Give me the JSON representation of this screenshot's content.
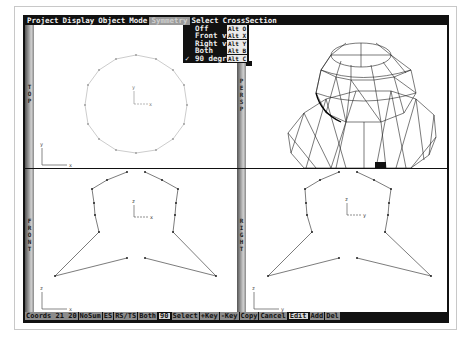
{
  "menubar": {
    "items": [
      "Project",
      "Display",
      "Object",
      "Mode",
      "Symmetry",
      "Select",
      "CrossSection"
    ],
    "active": "Symmetry"
  },
  "symmetry_menu": {
    "items": [
      {
        "label": "Off",
        "shortcut": "Alt O",
        "checked": false
      },
      {
        "label": "Front view",
        "shortcut": "Alt X",
        "checked": false
      },
      {
        "label": "Right view",
        "shortcut": "Alt Y",
        "checked": false
      },
      {
        "label": "Both",
        "shortcut": "Alt B",
        "checked": false
      },
      {
        "label": "90 degree",
        "shortcut": "Alt C",
        "checked": true
      }
    ],
    "check_glyph": "✓"
  },
  "viewports": {
    "top": {
      "label": "TOP",
      "axis_h": "x",
      "axis_v": "y",
      "center_h": "x",
      "center_v": "y"
    },
    "persp": {
      "label": "PERSP"
    },
    "front": {
      "label": "FRONT",
      "axis_h": "x",
      "axis_v": "z",
      "center_h": "x",
      "center_v": "z"
    },
    "right": {
      "label": "RIGHT",
      "axis_h": "y",
      "axis_v": "z",
      "center_h": "y",
      "center_v": "z"
    }
  },
  "statusbar": {
    "coords_label": "Coords",
    "coords_x": "21",
    "coords_y": "20",
    "items": [
      "NoSum",
      "ES",
      "RS/TS",
      "Both",
      "90",
      "Select",
      "+Key",
      "-Key",
      "Copy",
      "Cancel",
      "Edit",
      "Add",
      "Del"
    ],
    "highlighted": [
      "90",
      "Edit"
    ]
  }
}
